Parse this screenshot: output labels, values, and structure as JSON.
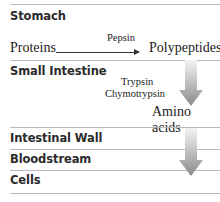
{
  "stages": [
    {
      "label": "Stomach"
    },
    {
      "label": "Small Intestine"
    },
    {
      "label": "Intestinal Wall"
    },
    {
      "label": "Bloodstream"
    },
    {
      "label": "Cells"
    }
  ],
  "reactions": {
    "stomach": {
      "substrate": "Proteins",
      "enzyme": "Pepsin",
      "product": "Polypeptides"
    },
    "small_intestine": {
      "enzymes": [
        "Trypsin",
        "Chymotrypsin"
      ],
      "product": "Amino acids"
    }
  },
  "colors": {
    "line": "#b8b8b8",
    "arrow_gradient_top": "#f2f2f2",
    "arrow_gradient_bottom": "#8a8a8a",
    "text": "#222222"
  }
}
